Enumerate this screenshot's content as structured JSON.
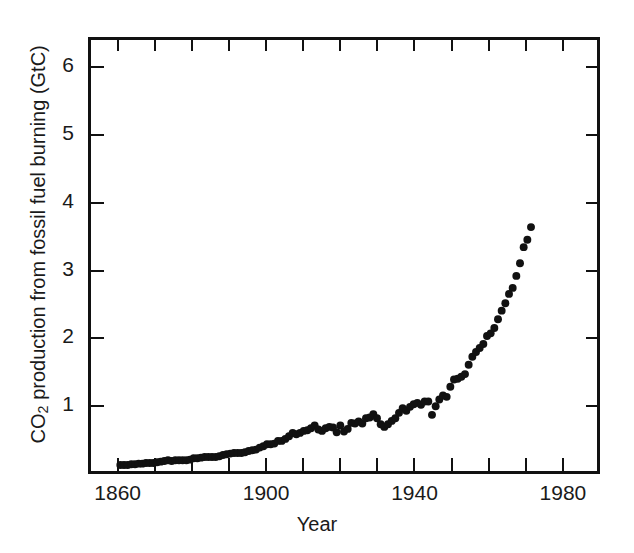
{
  "chart_data": {
    "type": "scatter",
    "title": "",
    "xlabel": "Year",
    "ylabel_text": "CO2 production from fossil fuel burning (GtC)",
    "ylabel_prefix": "CO",
    "ylabel_sub": "2",
    "ylabel_suffix": " production from fossil fuel burning (GtC)",
    "xlim": [
      1852,
      1990
    ],
    "ylim": [
      0,
      6.45
    ],
    "xticks": [
      1860,
      1870,
      1880,
      1890,
      1900,
      1910,
      1920,
      1930,
      1940,
      1950,
      1960,
      1970,
      1980
    ],
    "xtick_labels": [
      {
        "value": 1860,
        "label": "1860"
      },
      {
        "value": 1900,
        "label": "1900"
      },
      {
        "value": 1940,
        "label": "1940"
      },
      {
        "value": 1980,
        "label": "1980"
      }
    ],
    "yticks": [
      1,
      2,
      3,
      4,
      5,
      6
    ],
    "ytick_labels": [
      "1",
      "2",
      "3",
      "4",
      "5",
      "6"
    ],
    "grid": false,
    "legend": null,
    "marker_color": "#111111",
    "marker_size": 4,
    "x": [
      1860,
      1861,
      1862,
      1863,
      1864,
      1865,
      1866,
      1867,
      1868,
      1869,
      1870,
      1871,
      1872,
      1873,
      1874,
      1875,
      1876,
      1877,
      1878,
      1879,
      1880,
      1881,
      1882,
      1883,
      1884,
      1885,
      1886,
      1887,
      1888,
      1889,
      1890,
      1891,
      1892,
      1893,
      1894,
      1895,
      1896,
      1897,
      1898,
      1899,
      1900,
      1901,
      1902,
      1903,
      1904,
      1905,
      1906,
      1907,
      1908,
      1909,
      1910,
      1911,
      1912,
      1913,
      1914,
      1915,
      1916,
      1917,
      1918,
      1919,
      1920,
      1921,
      1922,
      1923,
      1924,
      1925,
      1926,
      1927,
      1928,
      1929,
      1930,
      1931,
      1932,
      1933,
      1934,
      1935,
      1936,
      1937,
      1938,
      1939,
      1940,
      1941,
      1942,
      1943,
      1944,
      1945,
      1946,
      1947,
      1948,
      1949,
      1950,
      1951,
      1952,
      1953,
      1954,
      1955,
      1956,
      1957,
      1958,
      1959,
      1960,
      1961,
      1962,
      1963,
      1964,
      1965,
      1966,
      1967,
      1968,
      1969,
      1970,
      1971,
      1972
    ],
    "y": [
      0.09,
      0.09,
      0.09,
      0.1,
      0.1,
      0.11,
      0.11,
      0.12,
      0.12,
      0.12,
      0.13,
      0.14,
      0.15,
      0.16,
      0.15,
      0.16,
      0.16,
      0.16,
      0.16,
      0.17,
      0.19,
      0.19,
      0.2,
      0.21,
      0.21,
      0.21,
      0.21,
      0.22,
      0.24,
      0.25,
      0.26,
      0.27,
      0.27,
      0.27,
      0.28,
      0.3,
      0.31,
      0.32,
      0.35,
      0.37,
      0.4,
      0.4,
      0.41,
      0.45,
      0.45,
      0.48,
      0.52,
      0.57,
      0.55,
      0.57,
      0.6,
      0.61,
      0.64,
      0.68,
      0.62,
      0.6,
      0.64,
      0.66,
      0.65,
      0.58,
      0.68,
      0.59,
      0.63,
      0.72,
      0.71,
      0.74,
      0.71,
      0.79,
      0.8,
      0.85,
      0.79,
      0.7,
      0.66,
      0.7,
      0.75,
      0.79,
      0.87,
      0.94,
      0.9,
      0.96,
      1.0,
      1.02,
      0.99,
      1.04,
      1.04,
      0.84,
      0.97,
      1.07,
      1.13,
      1.11,
      1.26,
      1.37,
      1.38,
      1.41,
      1.45,
      1.59,
      1.71,
      1.78,
      1.84,
      1.9,
      2.02,
      2.06,
      2.14,
      2.27,
      2.4,
      2.51,
      2.65,
      2.74,
      2.92,
      3.11,
      3.35,
      3.46,
      3.65,
      3.85,
      4.06,
      4.21,
      4.42,
      4.73,
      4.78,
      4.99,
      5.35
    ]
  }
}
